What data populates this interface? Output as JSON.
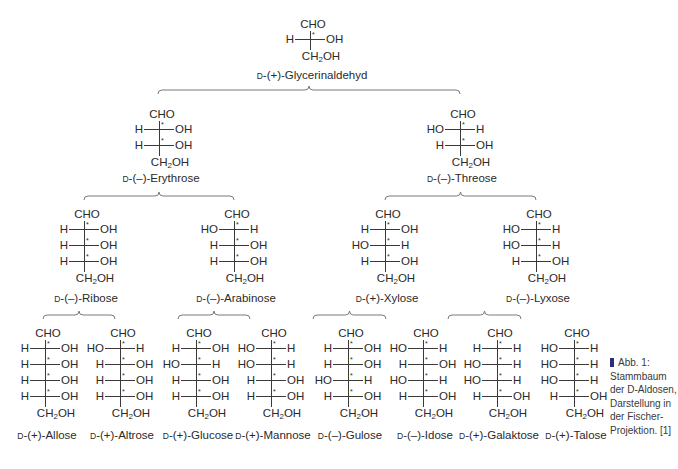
{
  "figure": {
    "caption": {
      "marker_color": "#2b2d7a",
      "lines": [
        "Abb. 1:",
        "Stammbaum",
        "der D-Aldosen,",
        "Darstellung in",
        "der Fischer-",
        "Projektion. [1]"
      ]
    },
    "common": {
      "top_group": "CHO",
      "bottom_group_prefix": "CH",
      "bottom_group_sub": "2",
      "bottom_group_suffix": "OH",
      "stereo_marker": "*",
      "d_prefix": "D"
    },
    "molecules": [
      {
        "id": "glycerinaldehyd",
        "name": "-(+)-Glycerinaldehyd",
        "x": 310,
        "y": 18,
        "label_y": 68,
        "rows": [
          [
            "H",
            "OH"
          ]
        ]
      },
      {
        "id": "erythrose",
        "name": "-(–)-Erythrose",
        "x": 159,
        "y": 108,
        "label_y": 171,
        "rows": [
          [
            "H",
            "OH"
          ],
          [
            "H",
            "OH"
          ]
        ]
      },
      {
        "id": "threose",
        "name": "-(–)-Threose",
        "x": 460,
        "y": 108,
        "label_y": 171,
        "rows": [
          [
            "HO",
            "H"
          ],
          [
            "H",
            "OH"
          ]
        ]
      },
      {
        "id": "ribose",
        "name": "-(–)-Ribose",
        "x": 84,
        "y": 208,
        "label_y": 291,
        "rows": [
          [
            "H",
            "OH"
          ],
          [
            "H",
            "OH"
          ],
          [
            "H",
            "OH"
          ]
        ]
      },
      {
        "id": "arabinose",
        "name": "-(–)-Arabinose",
        "x": 234,
        "y": 208,
        "label_y": 291,
        "rows": [
          [
            "HO",
            "H"
          ],
          [
            "H",
            "OH"
          ],
          [
            "H",
            "OH"
          ]
        ]
      },
      {
        "id": "xylose",
        "name": "-(+)-Xylose",
        "x": 385,
        "y": 208,
        "label_y": 291,
        "rows": [
          [
            "H",
            "OH"
          ],
          [
            "HO",
            "H"
          ],
          [
            "H",
            "OH"
          ]
        ]
      },
      {
        "id": "lyxose",
        "name": "-(–)-Lyxose",
        "x": 536,
        "y": 208,
        "label_y": 291,
        "rows": [
          [
            "HO",
            "H"
          ],
          [
            "HO",
            "H"
          ],
          [
            "H",
            "OH"
          ]
        ]
      },
      {
        "id": "allose",
        "name": "-(+)-Allose",
        "x": 45,
        "y": 327,
        "label_y": 428,
        "rows": [
          [
            "H",
            "OH"
          ],
          [
            "H",
            "OH"
          ],
          [
            "H",
            "OH"
          ],
          [
            "H",
            "OH"
          ]
        ]
      },
      {
        "id": "altrose",
        "name": "-(+)-Altrose",
        "x": 120,
        "y": 327,
        "label_y": 428,
        "rows": [
          [
            "HO",
            "H"
          ],
          [
            "H",
            "OH"
          ],
          [
            "H",
            "OH"
          ],
          [
            "H",
            "OH"
          ]
        ]
      },
      {
        "id": "glucose",
        "name": "-(+)-Glucose",
        "x": 196,
        "y": 327,
        "label_y": 428,
        "rows": [
          [
            "H",
            "OH"
          ],
          [
            "HO",
            "H"
          ],
          [
            "H",
            "OH"
          ],
          [
            "H",
            "OH"
          ]
        ]
      },
      {
        "id": "mannose",
        "name": "-(+)-Mannose",
        "x": 271,
        "y": 327,
        "label_y": 428,
        "rows": [
          [
            "HO",
            "H"
          ],
          [
            "HO",
            "H"
          ],
          [
            "H",
            "OH"
          ],
          [
            "H",
            "OH"
          ]
        ]
      },
      {
        "id": "gulose",
        "name": "-(–)-Gulose",
        "x": 348,
        "y": 327,
        "label_y": 428,
        "rows": [
          [
            "H",
            "OH"
          ],
          [
            "H",
            "OH"
          ],
          [
            "HO",
            "H"
          ],
          [
            "H",
            "OH"
          ]
        ]
      },
      {
        "id": "idose",
        "name": "-(–)-Idose",
        "x": 423,
        "y": 327,
        "label_y": 428,
        "rows": [
          [
            "HO",
            "H"
          ],
          [
            "H",
            "OH"
          ],
          [
            "HO",
            "H"
          ],
          [
            "H",
            "OH"
          ]
        ]
      },
      {
        "id": "galaktose",
        "name": "-(+)-Galaktose",
        "x": 497,
        "y": 327,
        "label_y": 428,
        "rows": [
          [
            "H",
            "H"
          ],
          [
            "HO",
            "H"
          ],
          [
            "HO",
            "H"
          ],
          [
            "H",
            "OH"
          ]
        ]
      },
      {
        "id": "talose",
        "name": "-(+)-Talose",
        "x": 574,
        "y": 327,
        "label_y": 428,
        "rows": [
          [
            "HO",
            "H"
          ],
          [
            "HO",
            "H"
          ],
          [
            "HO",
            "H"
          ],
          [
            "H",
            "OH"
          ]
        ]
      }
    ],
    "braces": [
      {
        "x1": 158,
        "x2": 460,
        "y": 90
      },
      {
        "x1": 84,
        "x2": 234,
        "y": 196
      },
      {
        "x1": 385,
        "x2": 536,
        "y": 196
      },
      {
        "x1": 43,
        "x2": 115,
        "y": 315
      },
      {
        "x1": 178,
        "x2": 250,
        "y": 315
      },
      {
        "x1": 313,
        "x2": 386,
        "y": 315
      },
      {
        "x1": 448,
        "x2": 521,
        "y": 315
      }
    ]
  }
}
